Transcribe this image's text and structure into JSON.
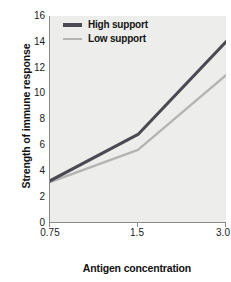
{
  "chart_data": {
    "type": "line",
    "title": "",
    "xlabel": "Antigen concentration",
    "ylabel": "Strength of immune response",
    "x": [
      0.75,
      1.5,
      3.0
    ],
    "xtick_labels": [
      "0.75",
      "1.5",
      "3.0"
    ],
    "ytick_labels": [
      "0",
      "2",
      "4",
      "6",
      "8",
      "10",
      "12",
      "14",
      "16"
    ],
    "ylim": [
      0,
      16
    ],
    "ytick_step": 2,
    "grid": false,
    "legend_position": "top-left-inside",
    "series": [
      {
        "name": "High support",
        "values": [
          3.2,
          6.8,
          14.0
        ],
        "color": "#4a4a52"
      },
      {
        "name": "Low support",
        "values": [
          3.1,
          5.6,
          11.4
        ],
        "color": "#b4b4b4"
      }
    ]
  },
  "legend": {
    "items": [
      {
        "label": "High support",
        "color": "#4a4a52"
      },
      {
        "label": "Low support",
        "color": "#b4b4b4"
      }
    ]
  },
  "axes": {
    "x_title": "Antigen concentration",
    "y_title": "Strength of immune response"
  },
  "colors": {
    "plot_background": "#ededeb",
    "axis_line": "#8a8a88",
    "text": "#111111",
    "high_support": "#4a4a52",
    "low_support": "#b4b4b4"
  }
}
